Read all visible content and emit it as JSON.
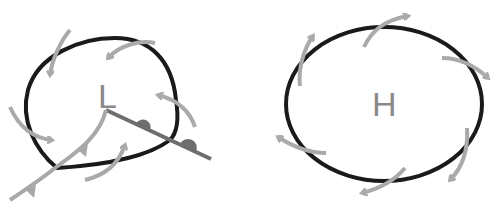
{
  "diagram": {
    "low_pressure": {
      "label": "L"
    },
    "high_pressure": {
      "label": "H"
    }
  },
  "colors": {
    "isobar": "#1a1a1a",
    "wind_arrow": "#aaaaaa",
    "cold_front": "#a8a8a8",
    "warm_front": "#6e6e6e",
    "label": "#8a8a8a"
  }
}
